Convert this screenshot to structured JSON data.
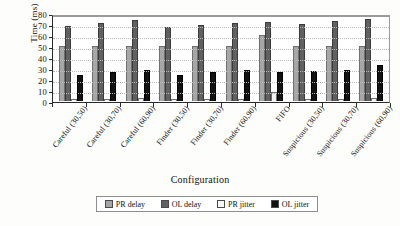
{
  "chart_data": {
    "type": "bar",
    "title": "",
    "xlabel": "Configuration",
    "ylabel": "Time (ms)",
    "ylim": [
      0,
      80
    ],
    "ytick_step": 10,
    "yticks": [
      80,
      70,
      60,
      50,
      40,
      30,
      20,
      10,
      0
    ],
    "grid": true,
    "grid_axis": "y",
    "legend_position": "bottom",
    "categories": [
      "Careful (30,50)",
      "Careful (30,70)",
      "Careful (60,90)",
      "Finder (30,50)",
      "Finder (30,70)",
      "Finder (60,90)",
      "FIFO",
      "Suspicious (30,50)",
      "Suspicious (30,70)",
      "Suspicious (60,90)"
    ],
    "series": [
      {
        "name": "PR delay",
        "color": "#a6a6a6",
        "values": [
          50,
          50,
          50,
          50,
          50,
          50,
          60,
          50,
          50,
          50
        ]
      },
      {
        "name": "OL delay",
        "color": "#606060",
        "values": [
          68,
          71,
          74,
          67,
          69,
          71,
          72,
          70,
          73,
          75
        ]
      },
      {
        "name": "PR jitter",
        "color": "#f2f2f2",
        "values": [
          2,
          2,
          3,
          2,
          2,
          2,
          8,
          2,
          2,
          3
        ]
      },
      {
        "name": "OL jitter",
        "color": "#121212",
        "values": [
          24,
          26,
          28,
          24,
          26,
          28,
          26,
          27,
          28,
          33
        ]
      }
    ]
  },
  "legend": {
    "items": [
      {
        "label": "PR delay"
      },
      {
        "label": "OL delay"
      },
      {
        "label": "PR jitter"
      },
      {
        "label": "OL jitter"
      }
    ]
  }
}
